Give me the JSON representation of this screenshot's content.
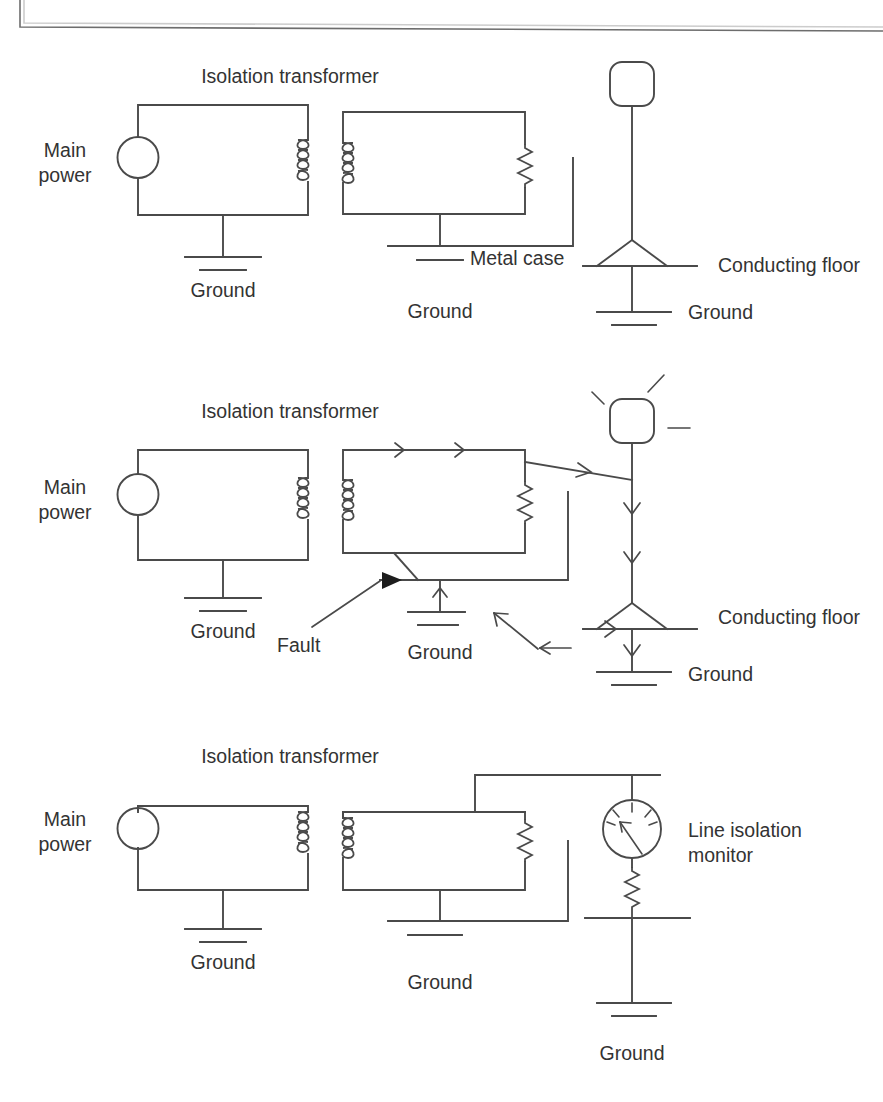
{
  "figure": {
    "title_bar_present": true,
    "panels": [
      {
        "id": "panel-1",
        "caption_role": "normal-operation",
        "labels": {
          "main_power": "Main\npower",
          "main_power_line1": "Main",
          "main_power_line2": "power",
          "isolation_transformer": "Isolation transformer",
          "ground_primary": "Ground",
          "ground_secondary": "Ground",
          "metal_case": "Metal case",
          "conducting_floor": "Conducting floor",
          "ground_floor": "Ground"
        }
      },
      {
        "id": "panel-2",
        "caption_role": "single-fault-condition",
        "labels": {
          "main_power_line1": "Main",
          "main_power_line2": "power",
          "isolation_transformer": "Isolation transformer",
          "ground_primary": "Ground",
          "ground_secondary": "Ground",
          "fault": "Fault",
          "conducting_floor": "Conducting floor",
          "ground_floor": "Ground"
        }
      },
      {
        "id": "panel-3",
        "caption_role": "line-isolation-monitor",
        "labels": {
          "main_power_line1": "Main",
          "main_power_line2": "power",
          "isolation_transformer": "Isolation transformer",
          "ground_primary": "Ground",
          "ground_secondary": "Ground",
          "line_isolation_monitor_line1": "Line isolation",
          "line_isolation_monitor_line2": "monitor",
          "ground_monitor": "Ground"
        }
      }
    ],
    "colors": {
      "stroke": "#4a4a4a",
      "text": "#333333",
      "fault_marker": "#1d1d1d",
      "background": "#ffffff",
      "frame": "#6d6d6d"
    },
    "symbols": {
      "ac_source": "circle-source-icon",
      "coil": "transformer-coil-icon",
      "resistor": "resistor-zigzag-icon",
      "ground": "ground-symbol-icon",
      "person": "person-figure-icon",
      "gauge": "analog-gauge-icon",
      "current_arrow": "current-direction-arrow-icon",
      "fault_arrow": "fault-pointer-icon"
    }
  }
}
